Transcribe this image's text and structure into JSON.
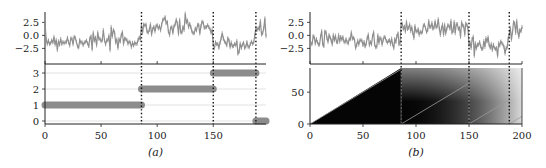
{
  "chart_data": [
    {
      "id": "a",
      "caption": "(a)",
      "type": "line",
      "panels": [
        {
          "role": "signal",
          "type": "line",
          "ylim": [
            -5.5,
            4.5
          ],
          "yticks": [
            2.5,
            0.0,
            -2.5
          ],
          "ytick_labels": [
            "2.5",
            "0.0",
            "−2.5"
          ],
          "segments": [
            {
              "x_range": [
                0,
                86
              ],
              "mean": -1.0
            },
            {
              "x_range": [
                86,
                150
              ],
              "mean": 1.5
            },
            {
              "x_range": [
                150,
                188
              ],
              "mean": -1.8
            },
            {
              "x_range": [
                188,
                197
              ],
              "mean": 1.2
            }
          ],
          "noise_sd": 0.9,
          "series_color": "#8f8f8f"
        },
        {
          "role": "segment-assignment",
          "type": "scatter",
          "ylim": [
            -0.1,
            3.3
          ],
          "yticks": [
            0,
            1,
            2,
            3
          ],
          "ytick_labels": [
            "0",
            "1",
            "2",
            "3"
          ],
          "segments": [
            {
              "label": 1,
              "x_range": [
                0,
                86
              ]
            },
            {
              "label": 2,
              "x_range": [
                86,
                150
              ]
            },
            {
              "label": 3,
              "x_range": [
                150,
                188
              ]
            },
            {
              "label": 0,
              "x_range": [
                188,
                197
              ]
            }
          ],
          "marker_color": "#8c8c8c",
          "grid": true
        }
      ],
      "xlim": [
        0,
        197
      ],
      "xticks": [
        0,
        50,
        100,
        150
      ],
      "xtick_labels": [
        "0",
        "50",
        "100",
        "150"
      ],
      "changepoints": [
        86,
        150,
        188
      ]
    },
    {
      "id": "b",
      "caption": "(b)",
      "type": "heatmap",
      "panels": [
        {
          "role": "signal",
          "type": "line",
          "ylim": [
            -5.5,
            4.5
          ],
          "yticks": [
            2.5,
            0.0,
            -2.5
          ],
          "ytick_labels": [
            "2.5",
            "0.0",
            "−2.5"
          ],
          "segments": [
            {
              "x_range": [
                0,
                86
              ],
              "mean": -1.0
            },
            {
              "x_range": [
                86,
                150
              ],
              "mean": 1.5
            },
            {
              "x_range": [
                150,
                188
              ],
              "mean": -1.8
            },
            {
              "x_range": [
                188,
                200
              ],
              "mean": 1.2
            }
          ],
          "noise_sd": 0.9,
          "series_color": "#8f8f8f"
        },
        {
          "role": "run-length-posterior",
          "type": "heatmap",
          "ylim": [
            0,
            88
          ],
          "yticks": [
            0,
            50
          ],
          "ytick_labels": [
            "0",
            "50"
          ],
          "map_run_length_resets": [
            0,
            86,
            150,
            188
          ],
          "colormap": "gray (black = high probability)"
        }
      ],
      "xlim": [
        0,
        200
      ],
      "xticks": [
        0,
        50,
        100,
        150,
        200
      ],
      "xtick_labels": [
        "0",
        "50",
        "100",
        "150",
        "200"
      ],
      "changepoints": [
        86,
        150,
        188
      ]
    }
  ]
}
